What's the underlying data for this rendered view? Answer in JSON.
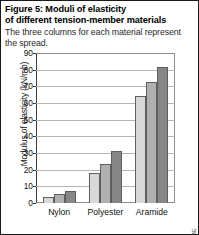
{
  "figure": {
    "title": "Figure 5: Moduli of elasticity of different tension-member materials",
    "title_line1": "Figure 5: Moduli of elasticity",
    "title_line2": "of different tension-member materials",
    "subtitle": "The three columns for each material represent the spread.",
    "side_code": "SAM01:24E"
  },
  "chart_data": {
    "type": "bar",
    "title": "Moduli of elasticity of different tension-member materials",
    "xlabel": "",
    "ylabel": "Modulus of elasticity (kN/mb)",
    "categories": [
      "Nylon",
      "Polyester",
      "Aramide"
    ],
    "series": [
      {
        "name": "low",
        "values": [
          3.5,
          18,
          64.5
        ],
        "color": "#d8d8d8"
      },
      {
        "name": "mid",
        "values": [
          5.5,
          23.5,
          72.5
        ],
        "color": "#b0b0b0"
      },
      {
        "name": "high",
        "values": [
          7.5,
          31.5,
          81.5
        ],
        "color": "#868686"
      }
    ],
    "ylim": [
      0,
      90
    ],
    "yticks": [
      0,
      10,
      20,
      30,
      40,
      50,
      60,
      70,
      80,
      90
    ],
    "grid": true,
    "legend": "none"
  }
}
